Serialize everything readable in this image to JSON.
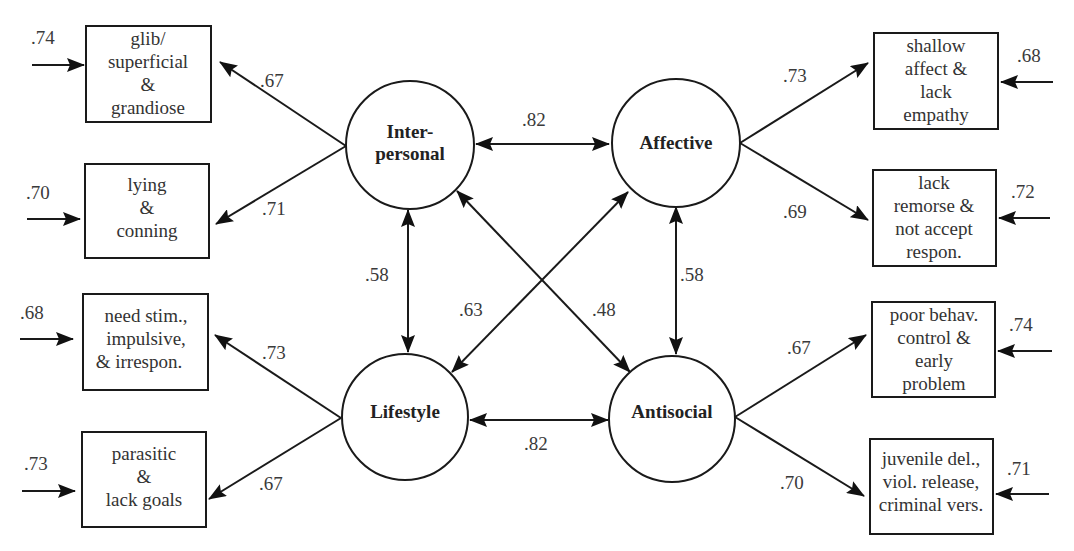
{
  "figure": {
    "factors": {
      "interpersonal": {
        "lines": [
          "Inter-",
          "personal"
        ]
      },
      "affective": {
        "lines": [
          "Affective"
        ]
      },
      "lifestyle": {
        "lines": [
          "Lifestyle"
        ]
      },
      "antisocial": {
        "lines": [
          "Antisocial"
        ]
      }
    },
    "indicators": [
      {
        "factor": "Interpersonal",
        "lines": [
          "glib/",
          "superficial",
          "&",
          "grandiose"
        ],
        "loading": ".67",
        "error": ".74"
      },
      {
        "factor": "Interpersonal",
        "lines": [
          "lying",
          "&",
          "conning"
        ],
        "loading": ".71",
        "error": ".70"
      },
      {
        "factor": "Lifestyle",
        "lines": [
          "need stim.,",
          "impulsive,",
          "& irrespon."
        ],
        "loading": ".73",
        "error": ".68"
      },
      {
        "factor": "Lifestyle",
        "lines": [
          "parasitic",
          "&",
          "lack goals"
        ],
        "loading": ".67",
        "error": ".73"
      },
      {
        "factor": "Affective",
        "lines": [
          "shallow",
          "affect &",
          "lack",
          "empathy"
        ],
        "loading": ".73",
        "error": ".68"
      },
      {
        "factor": "Affective",
        "lines": [
          "lack",
          "remorse &",
          "not accept",
          "respon."
        ],
        "loading": ".69",
        "error": ".72"
      },
      {
        "factor": "Antisocial",
        "lines": [
          "poor behav.",
          "control &",
          "early",
          "problem"
        ],
        "loading": ".67",
        "error": ".74"
      },
      {
        "factor": "Antisocial",
        "lines": [
          "juvenile del.,",
          "viol. release,",
          "criminal vers."
        ],
        "loading": ".70",
        "error": ".71"
      }
    ],
    "correlations": {
      "interpersonal_affective": ".82",
      "interpersonal_lifestyle": ".58",
      "affective_antisocial": ".58",
      "affective_lifestyle": ".63",
      "interpersonal_antisocial": ".48",
      "lifestyle_antisocial": ".82"
    },
    "colors": {
      "stroke": "#1a1a1a",
      "text": "#333333",
      "background": "#ffffff"
    }
  }
}
